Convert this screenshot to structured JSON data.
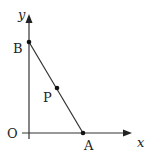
{
  "diagram": {
    "type": "coordinate-geometry",
    "axes": {
      "x_label": "x",
      "y_label": "y",
      "origin_label": "O"
    },
    "points": [
      {
        "name": "B",
        "label": "B",
        "location": "on y-axis"
      },
      {
        "name": "A",
        "label": "A",
        "location": "on x-axis"
      },
      {
        "name": "P",
        "label": "P",
        "location": "on segment AB"
      }
    ],
    "segments": [
      {
        "from": "A",
        "to": "B"
      }
    ],
    "colors": {
      "stroke": "#333333",
      "text": "#222222",
      "background": "#ffffff"
    }
  }
}
